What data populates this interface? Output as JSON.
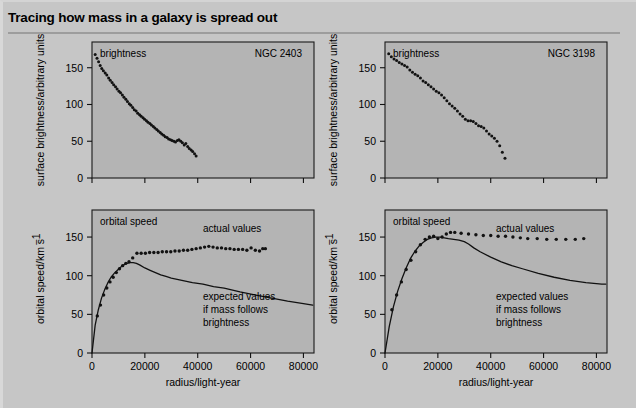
{
  "title": "Tracing how mass in a galaxy is spread out",
  "caption": "",
  "colors": {
    "page_background": "#c6c6c6",
    "plot_background": "#b4b4b4",
    "ink": "#111111",
    "rule": "#9d9d9d"
  },
  "axis_labels": {
    "brightness_y": "surface brightness/arbitrary units",
    "speed_y": "orbital speed/km s",
    "speed_y_exponent": "−1",
    "radius_x": "radius/light-year"
  },
  "annotations": {
    "brightness_tag": "brightness",
    "speed_tag": "orbital speed",
    "actual": "actual values",
    "expected_line1": "expected values",
    "expected_line2": "if mass follows",
    "expected_line3": "brightness"
  },
  "galaxies": [
    {
      "id": "ngc2403",
      "name": "NGC 2403"
    },
    {
      "id": "ngc3198",
      "name": "NGC 3198"
    }
  ],
  "chart_data": [
    {
      "id": "ngc2403-brightness",
      "type": "scatter",
      "title": "brightness",
      "annotation": "NGC 2403",
      "xlabel": "",
      "ylabel": "surface brightness/arbitrary units",
      "xlim": [
        0,
        84000
      ],
      "ylim": [
        0,
        185
      ],
      "yticks": [
        0,
        50,
        100,
        150
      ],
      "xticks": [
        0,
        20000,
        40000,
        60000,
        80000
      ],
      "xtick_labels": [
        "",
        "",
        "",
        "",
        ""
      ],
      "grid": false,
      "legend": "none",
      "x": [
        1200,
        1900,
        2500,
        3100,
        3700,
        4300,
        5000,
        5600,
        6300,
        6900,
        7600,
        8200,
        8900,
        9500,
        10200,
        10800,
        11500,
        12100,
        12800,
        13400,
        14100,
        14700,
        15400,
        16000,
        16700,
        17300,
        18000,
        18600,
        19300,
        19900,
        20600,
        21200,
        21900,
        22500,
        23200,
        23800,
        24500,
        25100,
        25800,
        26400,
        27100,
        27700,
        28400,
        29000,
        29700,
        30300,
        31000,
        31600,
        32300,
        32900,
        33600,
        34200,
        34900,
        35500,
        36200,
        36800,
        37500,
        38100,
        38800,
        39400
      ],
      "y": [
        168,
        163,
        158,
        153,
        149,
        146,
        143,
        140,
        136,
        133,
        130,
        127,
        124,
        121,
        118,
        116,
        113,
        110,
        107,
        104,
        101,
        99,
        96,
        93,
        91,
        88,
        86,
        84,
        82,
        80,
        78,
        76,
        74,
        72,
        70,
        68,
        66,
        64,
        62,
        60,
        58,
        56,
        55,
        53,
        52,
        51,
        50,
        49,
        51,
        52,
        50,
        48,
        45,
        47,
        43,
        40,
        38,
        36,
        33,
        30
      ]
    },
    {
      "id": "ngc2403-speed",
      "type": "line+scatter",
      "title": "orbital speed",
      "annotation": "",
      "xlabel": "radius/light-year",
      "ylabel": "orbital speed/km s−1",
      "xlim": [
        0,
        84000
      ],
      "ylim": [
        0,
        185
      ],
      "yticks": [
        0,
        50,
        100,
        150
      ],
      "xticks": [
        0,
        20000,
        40000,
        60000,
        80000
      ],
      "xtick_labels": [
        "0",
        "20000",
        "40000",
        "60000",
        "80000"
      ],
      "grid": false,
      "legend": "inline",
      "series": [
        {
          "name": "actual values",
          "kind": "scatter",
          "x": [
            2000,
            3200,
            4400,
            5600,
            6800,
            8000,
            9200,
            10400,
            11600,
            12800,
            14000,
            15400,
            17000,
            18600,
            20200,
            21800,
            23400,
            25000,
            26600,
            28200,
            29800,
            31400,
            33000,
            34600,
            36200,
            37800,
            39400,
            41000,
            42600,
            44200,
            45800,
            47400,
            49000,
            50600,
            52200,
            53800,
            55400,
            57000,
            58600,
            60200,
            61800,
            63400,
            64600,
            65600
          ],
          "y": [
            48,
            62,
            75,
            84,
            92,
            98,
            104,
            109,
            113,
            116,
            118,
            123,
            129,
            129,
            129,
            130,
            130,
            130,
            131,
            131,
            131,
            132,
            132,
            133,
            133,
            134,
            135,
            136,
            137,
            138,
            137,
            136,
            136,
            135,
            135,
            134,
            134,
            134,
            133,
            136,
            133,
            132,
            135,
            135
          ]
        },
        {
          "name": "expected values if mass follows brightness",
          "kind": "line",
          "x": [
            0,
            1200,
            2400,
            3600,
            4800,
            6000,
            7200,
            8400,
            9600,
            10800,
            12000,
            13200,
            14400,
            15600,
            16800,
            18000,
            20000,
            22000,
            24000,
            26000,
            28000,
            30000,
            34000,
            38000,
            42000,
            46000,
            50000,
            56000,
            62000,
            68000,
            74000,
            80000,
            83500
          ],
          "y": [
            0,
            36,
            56,
            71,
            82,
            91,
            98,
            103,
            107,
            111,
            114,
            116,
            117,
            117,
            116,
            114,
            110,
            107,
            104,
            101,
            99,
            97,
            94,
            91,
            89,
            86,
            84,
            79,
            75,
            71,
            67,
            64,
            62
          ]
        }
      ]
    },
    {
      "id": "ngc3198-brightness",
      "type": "scatter",
      "title": "brightness",
      "annotation": "NGC 3198",
      "xlabel": "",
      "ylabel": "surface brightness/arbitrary units",
      "xlim": [
        0,
        84000
      ],
      "ylim": [
        0,
        185
      ],
      "yticks": [
        0,
        50,
        100,
        150
      ],
      "xticks": [
        0,
        20000,
        40000,
        60000,
        80000
      ],
      "xtick_labels": [
        "",
        "",
        "",
        "",
        ""
      ],
      "grid": false,
      "legend": "none",
      "x": [
        1400,
        2400,
        3400,
        4400,
        5400,
        6400,
        7400,
        8400,
        9400,
        10400,
        11400,
        12400,
        13400,
        14400,
        15400,
        16400,
        17400,
        18400,
        19400,
        20400,
        21400,
        22400,
        23400,
        24400,
        25400,
        26400,
        27400,
        28400,
        29400,
        30400,
        31400,
        32400,
        33400,
        34400,
        35400,
        36400,
        37400,
        38400,
        39400,
        40400,
        41400,
        42400,
        43400,
        44400,
        45400
      ],
      "y": [
        169,
        165,
        162,
        160,
        157,
        155,
        153,
        151,
        147,
        144,
        141,
        139,
        136,
        132,
        130,
        127,
        124,
        121,
        118,
        116,
        113,
        109,
        105,
        101,
        98,
        95,
        91,
        87,
        84,
        80,
        78,
        78,
        77,
        74,
        71,
        70,
        68,
        64,
        60,
        57,
        54,
        50,
        44,
        35,
        27
      ]
    },
    {
      "id": "ngc3198-speed",
      "type": "line+scatter",
      "title": "orbital speed",
      "annotation": "",
      "xlabel": "radius/light-year",
      "ylabel": "orbital speed/km s−1",
      "xlim": [
        0,
        84000
      ],
      "ylim": [
        0,
        185
      ],
      "yticks": [
        0,
        50,
        100,
        150
      ],
      "xticks": [
        0,
        20000,
        40000,
        60000,
        80000
      ],
      "xtick_labels": [
        "0",
        "20000",
        "40000",
        "60000",
        "80000"
      ],
      "grid": false,
      "legend": "inline",
      "series": [
        {
          "name": "actual values",
          "kind": "scatter",
          "x": [
            2600,
            4400,
            6200,
            8000,
            9800,
            11600,
            13400,
            15200,
            16800,
            18400,
            20000,
            21600,
            23200,
            24800,
            26400,
            28800,
            31600,
            34400,
            37200,
            40000,
            42800,
            45600,
            48400,
            51200,
            54000,
            57600,
            61200,
            64800,
            68400,
            72000,
            75200
          ],
          "y": [
            56,
            75,
            92,
            108,
            120,
            131,
            140,
            147,
            150,
            151,
            148,
            150,
            154,
            156,
            156,
            155,
            154,
            153,
            152,
            152,
            151,
            151,
            150,
            149,
            148,
            148,
            147,
            147,
            147,
            147,
            148
          ]
        },
        {
          "name": "expected values if mass follows brightness",
          "kind": "line",
          "x": [
            0,
            1600,
            3200,
            4800,
            6400,
            8000,
            9600,
            11200,
            12800,
            14400,
            16000,
            17600,
            19200,
            20800,
            22400,
            24000,
            26000,
            28000,
            30000,
            31600,
            33600,
            36000,
            40000,
            44000,
            48000,
            52000,
            58000,
            64000,
            70000,
            76000,
            82000,
            83500
          ],
          "y": [
            0,
            34,
            60,
            80,
            96,
            110,
            122,
            131,
            138,
            143,
            147,
            149,
            150,
            150,
            149,
            148,
            147,
            146,
            144,
            141,
            136,
            131,
            124,
            118,
            113,
            109,
            103,
            98,
            94,
            91,
            89,
            89
          ]
        }
      ]
    }
  ]
}
